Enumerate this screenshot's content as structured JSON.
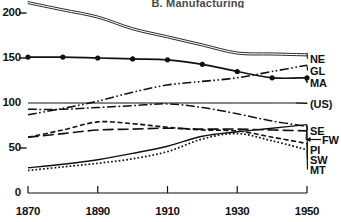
{
  "chart_data": {
    "type": "line",
    "title": "B. Manufacturing",
    "xlabel": "",
    "ylabel": "",
    "xlim": [
      1870,
      1950
    ],
    "ylim": [
      0,
      210
    ],
    "yticks": [
      0,
      50,
      100,
      150,
      200
    ],
    "xticks": [
      1870,
      1890,
      1910,
      1930,
      1950
    ],
    "grid": false,
    "legend_position": "right-of-axes",
    "x": [
      1870,
      1880,
      1890,
      1900,
      1910,
      1920,
      1930,
      1940,
      1950
    ],
    "series": [
      {
        "name": "NE",
        "label": "NE",
        "style": "double-solid",
        "values": [
          212,
          204,
          196,
          183,
          174,
          165,
          156,
          155,
          154
        ]
      },
      {
        "name": "GL",
        "label": "GL",
        "style": "dash-dot-dot",
        "values": [
          87,
          94,
          102,
          112,
          120,
          124,
          128,
          135,
          142
        ]
      },
      {
        "name": "MA",
        "label": "MA",
        "style": "solid-markers",
        "markers": true,
        "values": [
          151,
          151,
          150,
          149,
          148,
          143,
          135,
          128,
          128
        ]
      },
      {
        "name": "(US)",
        "label": "(US)",
        "style": "thin-solid",
        "values": [
          100,
          100,
          100,
          100,
          100,
          100,
          100,
          100,
          100
        ]
      },
      {
        "name": "SE",
        "label": "SE",
        "style": "solid",
        "values": [
          28,
          32,
          37,
          44,
          52,
          63,
          68,
          72,
          76
        ]
      },
      {
        "name": "FW",
        "label": "FW",
        "style": "dash-dot",
        "values": [
          93,
          93,
          95,
          97,
          99,
          95,
          88,
          80,
          74
        ]
      },
      {
        "name": "PI",
        "label": "PI",
        "style": "long-dash",
        "values": [
          62,
          66,
          70,
          71,
          72,
          71,
          71,
          70,
          69
        ]
      },
      {
        "name": "SW",
        "label": "SW",
        "style": "short-dash",
        "values": [
          62,
          70,
          79,
          77,
          73,
          70,
          69,
          62,
          55
        ]
      },
      {
        "name": "MT",
        "label": "MT",
        "style": "dotted",
        "values": [
          25,
          29,
          33,
          38,
          46,
          60,
          66,
          58,
          48
        ]
      }
    ]
  },
  "axes": {
    "ytick_labels": [
      "200",
      "150",
      "100",
      "50",
      "0"
    ],
    "xtick_labels": [
      "1870",
      "1890",
      "1910",
      "1930",
      "1950"
    ]
  },
  "legend": {
    "items": [
      {
        "label": "NE"
      },
      {
        "label": "GL"
      },
      {
        "label": "MA"
      },
      {
        "label": "(US)"
      },
      {
        "label": "SE"
      },
      {
        "label": "FW"
      },
      {
        "label": "PI"
      },
      {
        "label": "SW"
      },
      {
        "label": "MT"
      }
    ]
  }
}
